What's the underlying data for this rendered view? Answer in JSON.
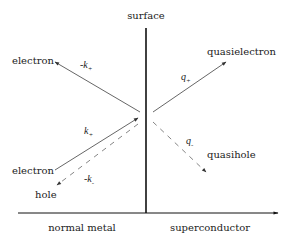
{
  "diagram": {
    "surface_label": "surface",
    "regions": {
      "left": "normal metal",
      "right": "superconductor"
    },
    "particles": {
      "reflected_electron": "electron",
      "incident_electron": "electron",
      "reflected_hole": "hole",
      "transmitted_quasielectron": "quasielectron",
      "transmitted_quasihole": "quasihole"
    },
    "wavevectors": {
      "reflected_electron": {
        "prefix": "-k",
        "sub": "+"
      },
      "incident_electron": {
        "prefix": "k",
        "sub": "+"
      },
      "reflected_hole": {
        "prefix": "-k",
        "sub": "-"
      },
      "quasielectron": {
        "prefix": "q",
        "sub": "+"
      },
      "quasihole": {
        "prefix": "q",
        "sub": "-"
      }
    },
    "line_styles": {
      "electron_like": "solid",
      "hole_like": "dashed"
    },
    "colors": {
      "axis": "#111111",
      "arrow": "#555555",
      "text": "#222222"
    }
  }
}
